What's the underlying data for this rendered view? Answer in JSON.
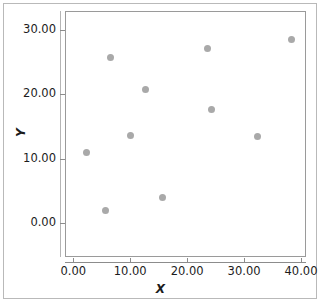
{
  "figure": {
    "top_fragment_text": "",
    "background_color": "#ffffff",
    "frame_color": "#9a9a9a",
    "marker_color": "#a9a9a9",
    "text_color": "#1c1c1c"
  },
  "chart_data": {
    "type": "scatter",
    "title": "",
    "xlabel": "X",
    "ylabel": "Y",
    "xlim": [
      -3.0,
      42.5
    ],
    "ylim": [
      -3.5,
      32.5
    ],
    "xticks": [
      0,
      10,
      20,
      30,
      40
    ],
    "xticklabels": [
      "0.00",
      "10.00",
      "20.00",
      "30.00",
      "40.00"
    ],
    "yticks": [
      0,
      10,
      20,
      30
    ],
    "yticklabels": [
      "0.00",
      "10.00",
      "20.00",
      "30.00"
    ],
    "grid": false,
    "legend": null,
    "marker_size_px": 7,
    "points": [
      {
        "x": 2.4,
        "y": 10.9
      },
      {
        "x": 5.6,
        "y": 2.0
      },
      {
        "x": 6.6,
        "y": 25.8
      },
      {
        "x": 10.1,
        "y": 13.6
      },
      {
        "x": 12.7,
        "y": 20.7
      },
      {
        "x": 15.6,
        "y": 3.9
      },
      {
        "x": 23.5,
        "y": 27.2
      },
      {
        "x": 24.2,
        "y": 17.6
      },
      {
        "x": 32.4,
        "y": 13.5
      },
      {
        "x": 38.4,
        "y": 28.6
      }
    ]
  }
}
